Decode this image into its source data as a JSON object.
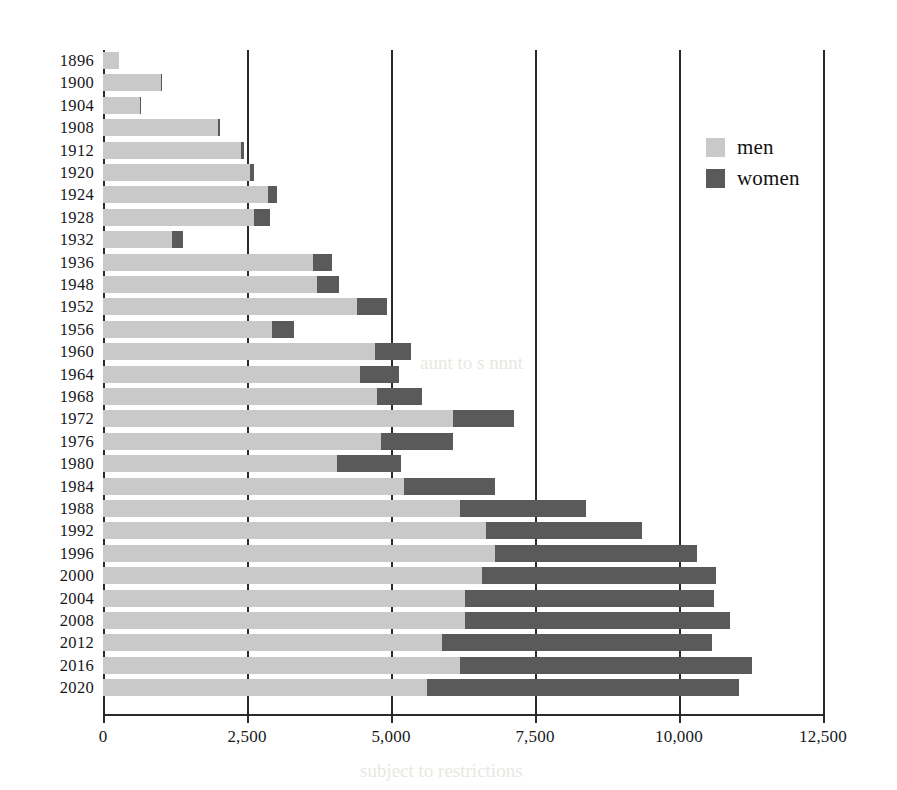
{
  "chart_data": {
    "type": "bar",
    "orientation": "horizontal",
    "stacked": true,
    "title": "",
    "subtitle": "",
    "xlabel": "",
    "ylabel": "",
    "xlim": [
      0,
      12500
    ],
    "xticks": [
      0,
      2500,
      5000,
      7500,
      10000,
      12500
    ],
    "xtick_labels": [
      "0",
      "2,500",
      "5,000",
      "7,500",
      "10,000",
      "12,500"
    ],
    "grid": "vertical",
    "legend_position": "top-right",
    "categories": [
      "1896",
      "1900",
      "1904",
      "1908",
      "1912",
      "1920",
      "1924",
      "1928",
      "1932",
      "1936",
      "1948",
      "1952",
      "1956",
      "1960",
      "1964",
      "1968",
      "1972",
      "1976",
      "1980",
      "1984",
      "1988",
      "1992",
      "1996",
      "2000",
      "2004",
      "2008",
      "2012",
      "2016",
      "2020"
    ],
    "series": [
      {
        "name": "men",
        "color": "#c9c9c9",
        "values": [
          280,
          1000,
          650,
          2000,
          2400,
          2550,
          2870,
          2620,
          1200,
          3640,
          3710,
          4410,
          2940,
          4730,
          4460,
          4750,
          6070,
          4820,
          4060,
          5230,
          6190,
          6650,
          6800,
          6580,
          6290,
          6290,
          5890,
          6190,
          5630
        ]
      },
      {
        "name": "women",
        "color": "#5a5a5a",
        "values": [
          0,
          20,
          10,
          40,
          50,
          70,
          150,
          280,
          190,
          330,
          390,
          520,
          380,
          610,
          680,
          780,
          1060,
          1260,
          1110,
          1570,
          2190,
          2700,
          3510,
          4070,
          4310,
          4600,
          4680,
          5080,
          5420
        ]
      }
    ],
    "totals": [
      280,
      1020,
      660,
      2040,
      2450,
      2620,
      3020,
      2900,
      1390,
      3970,
      4100,
      4930,
      3320,
      5340,
      5140,
      5530,
      7130,
      6080,
      5170,
      6800,
      8380,
      9350,
      10310,
      10650,
      10600,
      10890,
      10570,
      11270,
      11050
    ]
  },
  "legend": {
    "items": [
      {
        "label": "men",
        "color": "#c9c9c9"
      },
      {
        "label": "women",
        "color": "#5a5a5a"
      }
    ]
  },
  "ghost_text": {
    "a": "aunt  to  s    nnnt",
    "b": "s ll  ll  ha",
    "c": "subject to  restrictions"
  }
}
